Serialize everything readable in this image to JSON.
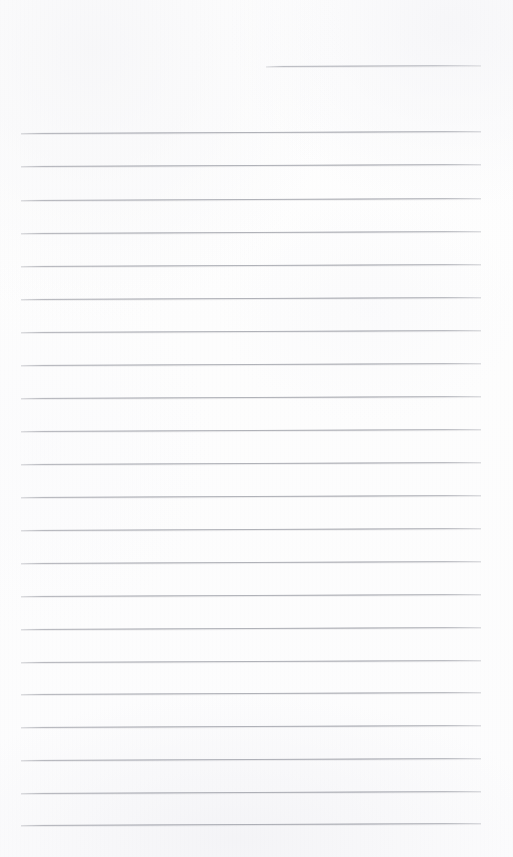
{
  "document": {
    "kind": "scanned-page",
    "surface": "lined notebook paper",
    "orientation": "portrait",
    "width_px": 513,
    "height_px": 857,
    "content_state": "blank",
    "written_text": "",
    "handwriting_present": false,
    "printed_text_present": false,
    "margin_rule_present": false,
    "holes_punched": false
  },
  "colors": {
    "paper": "#fdfdfd",
    "paper_highlight": "#fefefe",
    "paper_shadow": "#fcfcfd",
    "rule_ink": "#7c7f8a",
    "rule_ink_faded": "#a0a2aa"
  },
  "ruling": {
    "style": "wide-ruled horizontal",
    "line_count_total": 23,
    "full_width_line_count": 22,
    "partial_line_count": 1,
    "line_spacing_px": 33.3,
    "line_thickness_px": 1,
    "left_margin_px": 21,
    "right_margin_px": 481,
    "rule_length_px": 460,
    "scan_skew_deg": -0.26,
    "first_full_line_y_px": 133,
    "last_line_y_px": 825
  },
  "lines": [
    {
      "index": 0,
      "y": 66,
      "x_start": 266,
      "x_end": 481,
      "width": 215,
      "kind": "partial",
      "role": "header-rule",
      "content": ""
    },
    {
      "index": 1,
      "y": 133,
      "x_start": 21,
      "x_end": 481,
      "width": 460,
      "kind": "full",
      "role": "body-rule",
      "content": ""
    },
    {
      "index": 2,
      "y": 166,
      "x_start": 21,
      "x_end": 481,
      "width": 460,
      "kind": "full",
      "role": "body-rule",
      "content": ""
    },
    {
      "index": 3,
      "y": 200,
      "x_start": 21,
      "x_end": 481,
      "width": 460,
      "kind": "full",
      "role": "body-rule",
      "content": ""
    },
    {
      "index": 4,
      "y": 233,
      "x_start": 21,
      "x_end": 481,
      "width": 460,
      "kind": "full",
      "role": "body-rule",
      "content": ""
    },
    {
      "index": 5,
      "y": 266,
      "x_start": 21,
      "x_end": 481,
      "width": 460,
      "kind": "full",
      "role": "body-rule",
      "content": ""
    },
    {
      "index": 6,
      "y": 299,
      "x_start": 21,
      "x_end": 481,
      "width": 460,
      "kind": "full",
      "role": "body-rule",
      "content": ""
    },
    {
      "index": 7,
      "y": 332,
      "x_start": 21,
      "x_end": 481,
      "width": 460,
      "kind": "full",
      "role": "body-rule",
      "content": ""
    },
    {
      "index": 8,
      "y": 365,
      "x_start": 21,
      "x_end": 481,
      "width": 460,
      "kind": "full",
      "role": "body-rule",
      "content": ""
    },
    {
      "index": 9,
      "y": 398,
      "x_start": 21,
      "x_end": 481,
      "width": 460,
      "kind": "full",
      "role": "body-rule",
      "content": ""
    },
    {
      "index": 10,
      "y": 431,
      "x_start": 21,
      "x_end": 481,
      "width": 460,
      "kind": "full",
      "role": "body-rule",
      "content": ""
    },
    {
      "index": 11,
      "y": 464,
      "x_start": 21,
      "x_end": 481,
      "width": 460,
      "kind": "full",
      "role": "body-rule",
      "content": ""
    },
    {
      "index": 12,
      "y": 497,
      "x_start": 21,
      "x_end": 481,
      "width": 460,
      "kind": "full",
      "role": "body-rule",
      "content": ""
    },
    {
      "index": 13,
      "y": 530,
      "x_start": 21,
      "x_end": 481,
      "width": 460,
      "kind": "full",
      "role": "body-rule",
      "content": ""
    },
    {
      "index": 14,
      "y": 563,
      "x_start": 21,
      "x_end": 481,
      "width": 460,
      "kind": "full",
      "role": "body-rule",
      "content": ""
    },
    {
      "index": 15,
      "y": 596,
      "x_start": 21,
      "x_end": 481,
      "width": 460,
      "kind": "full",
      "role": "body-rule",
      "content": ""
    },
    {
      "index": 16,
      "y": 629,
      "x_start": 21,
      "x_end": 481,
      "width": 460,
      "kind": "full",
      "role": "body-rule",
      "content": ""
    },
    {
      "index": 17,
      "y": 662,
      "x_start": 21,
      "x_end": 481,
      "width": 460,
      "kind": "full",
      "role": "body-rule",
      "content": ""
    },
    {
      "index": 18,
      "y": 694,
      "x_start": 21,
      "x_end": 481,
      "width": 460,
      "kind": "full",
      "role": "body-rule",
      "content": ""
    },
    {
      "index": 19,
      "y": 727,
      "x_start": 21,
      "x_end": 481,
      "width": 460,
      "kind": "full",
      "role": "body-rule",
      "content": ""
    },
    {
      "index": 20,
      "y": 760,
      "x_start": 21,
      "x_end": 481,
      "width": 460,
      "kind": "full",
      "role": "body-rule",
      "content": ""
    },
    {
      "index": 21,
      "y": 793,
      "x_start": 21,
      "x_end": 481,
      "width": 460,
      "kind": "full",
      "role": "body-rule",
      "content": ""
    },
    {
      "index": 22,
      "y": 825,
      "x_start": 21,
      "x_end": 481,
      "width": 460,
      "kind": "full",
      "role": "body-rule",
      "content": ""
    }
  ],
  "transcription": []
}
